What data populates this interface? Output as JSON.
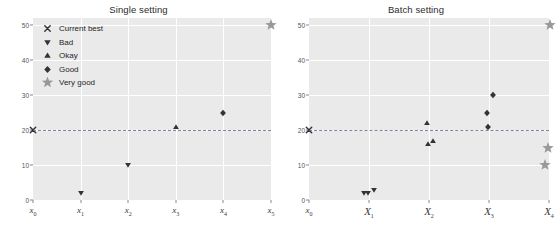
{
  "figure": {
    "width": 555,
    "height": 236,
    "background": "#ffffff",
    "plot_background": "#eaeaea",
    "grid_color": "#ffffff",
    "threshold_color": "#6e6e8a",
    "marker_dark": "#333333",
    "marker_gray": "#999999"
  },
  "legend": {
    "position": "upper-left-of-left-panel",
    "items": [
      {
        "label": "Current best",
        "marker": "x-cross-icon",
        "color": "#333333"
      },
      {
        "label": "Bad",
        "marker": "triangle-down-icon",
        "color": "#333333"
      },
      {
        "label": "Okay",
        "marker": "triangle-up-icon",
        "color": "#333333"
      },
      {
        "label": "Good",
        "marker": "diamond-icon",
        "color": "#333333"
      },
      {
        "label": "Very good",
        "marker": "star-icon",
        "color": "#999999"
      }
    ]
  },
  "chart_data": [
    {
      "type": "scatter",
      "title": "Single setting",
      "xlabel": "",
      "ylabel": "",
      "ylim": [
        0,
        52
      ],
      "yticks": [
        0,
        10,
        20,
        30,
        40,
        50
      ],
      "ytick_labels": [
        "0",
        "10",
        "20",
        "30",
        "40",
        "50"
      ],
      "xtick_labels": [
        "x0",
        "x1",
        "x2",
        "x3",
        "x4",
        "x5"
      ],
      "xtick_display": [
        "x",
        "x",
        "x",
        "x",
        "x",
        "x"
      ],
      "xtick_subscripts": [
        "0",
        "1",
        "2",
        "3",
        "4",
        "5"
      ],
      "grid": true,
      "legend_position": "upper left",
      "annotations": [
        {
          "name": "threshold-line",
          "y": 20,
          "style": "dashed",
          "label": "current best level"
        }
      ],
      "points": [
        {
          "x_index": 0,
          "x_label": "x0",
          "y": 20,
          "category": "Current best",
          "marker": "x-cross-icon",
          "color": "#333333"
        },
        {
          "x_index": 1,
          "x_label": "x1",
          "y": 2,
          "category": "Bad",
          "marker": "triangle-down-icon",
          "color": "#333333"
        },
        {
          "x_index": 2,
          "x_label": "x2",
          "y": 10,
          "category": "Bad",
          "marker": "triangle-down-icon",
          "color": "#333333"
        },
        {
          "x_index": 3,
          "x_label": "x3",
          "y": 21,
          "category": "Okay",
          "marker": "triangle-up-icon",
          "color": "#333333"
        },
        {
          "x_index": 4,
          "x_label": "x4",
          "y": 25,
          "category": "Good",
          "marker": "diamond-icon",
          "color": "#333333"
        },
        {
          "x_index": 5,
          "x_label": "x5",
          "y": 50,
          "category": "Very good",
          "marker": "star-icon",
          "color": "#999999"
        }
      ]
    },
    {
      "type": "scatter",
      "title": "Batch setting",
      "xlabel": "",
      "ylabel": "",
      "ylim": [
        0,
        52
      ],
      "yticks": [
        0,
        10,
        20,
        30,
        40,
        50
      ],
      "ytick_labels": [
        "0",
        "10",
        "20",
        "30",
        "40",
        "50"
      ],
      "xtick_labels": [
        "x0",
        "X1",
        "X2",
        "X3",
        "X4"
      ],
      "xtick_display": [
        "x",
        "X",
        "X",
        "X",
        "X"
      ],
      "xtick_subscripts": [
        "0",
        "1",
        "2",
        "3",
        "4"
      ],
      "grid": true,
      "legend_position": "none",
      "annotations": [
        {
          "name": "threshold-line",
          "y": 20,
          "style": "dashed",
          "label": "current best level"
        }
      ],
      "points": [
        {
          "x_index": 0,
          "x_offset": 0.0,
          "x_label": "x0",
          "y": 20,
          "category": "Current best",
          "marker": "x-cross-icon",
          "color": "#333333"
        },
        {
          "x_index": 1,
          "x_offset": -0.09,
          "x_label": "X1",
          "y": 2,
          "category": "Bad",
          "marker": "triangle-down-icon",
          "color": "#333333"
        },
        {
          "x_index": 1,
          "x_offset": -0.02,
          "x_label": "X1",
          "y": 2,
          "category": "Bad",
          "marker": "triangle-down-icon",
          "color": "#333333"
        },
        {
          "x_index": 1,
          "x_offset": 0.08,
          "x_label": "X1",
          "y": 3,
          "category": "Bad",
          "marker": "triangle-down-icon",
          "color": "#333333"
        },
        {
          "x_index": 2,
          "x_offset": -0.04,
          "x_label": "X2",
          "y": 22,
          "category": "Okay",
          "marker": "triangle-up-icon",
          "color": "#333333"
        },
        {
          "x_index": 2,
          "x_offset": -0.02,
          "x_label": "X2",
          "y": 16,
          "category": "Okay",
          "marker": "triangle-up-icon",
          "color": "#333333"
        },
        {
          "x_index": 2,
          "x_offset": 0.06,
          "x_label": "X2",
          "y": 17,
          "category": "Okay",
          "marker": "triangle-up-icon",
          "color": "#333333"
        },
        {
          "x_index": 3,
          "x_offset": 0.06,
          "x_label": "X3",
          "y": 30,
          "category": "Good",
          "marker": "diamond-icon",
          "color": "#333333"
        },
        {
          "x_index": 3,
          "x_offset": -0.03,
          "x_label": "X3",
          "y": 25,
          "category": "Good",
          "marker": "diamond-icon",
          "color": "#333333"
        },
        {
          "x_index": 3,
          "x_offset": -0.02,
          "x_label": "X3",
          "y": 21,
          "category": "Good",
          "marker": "diamond-icon",
          "color": "#333333"
        },
        {
          "x_index": 4,
          "x_offset": 0.02,
          "x_label": "X4",
          "y": 50,
          "category": "Very good",
          "marker": "star-icon",
          "color": "#999999"
        },
        {
          "x_index": 4,
          "x_offset": -0.02,
          "x_label": "X4",
          "y": 15,
          "category": "Very good",
          "marker": "star-icon",
          "color": "#999999"
        },
        {
          "x_index": 4,
          "x_offset": -0.06,
          "x_label": "X4",
          "y": 10,
          "category": "Very good",
          "marker": "star-icon",
          "color": "#999999"
        }
      ]
    }
  ]
}
